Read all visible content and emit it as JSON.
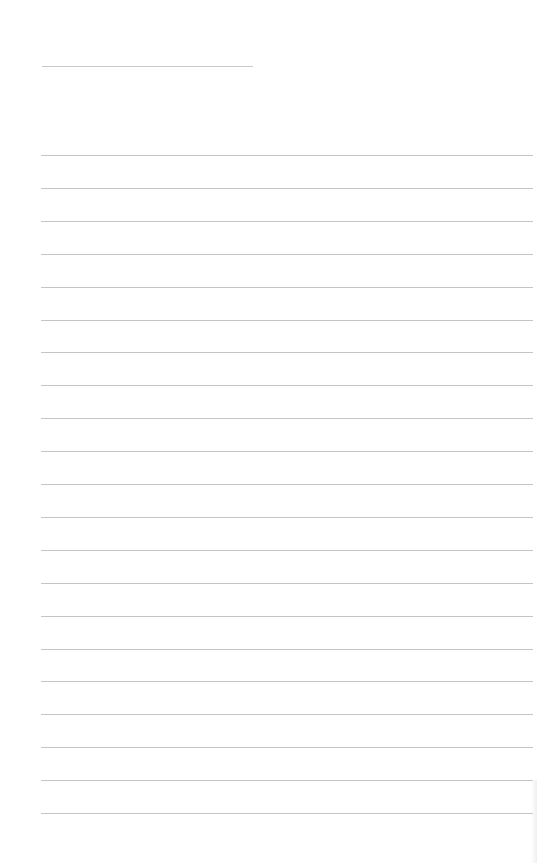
{
  "page": {
    "type": "lined-writing-sheet",
    "title_line": {
      "x": 42,
      "y": 66,
      "width": 211
    },
    "rules": {
      "count": 21,
      "start_y": 155,
      "spacing": 32.9,
      "left": 41,
      "width": 492,
      "color": "#c4c4c4"
    },
    "text_content": []
  }
}
